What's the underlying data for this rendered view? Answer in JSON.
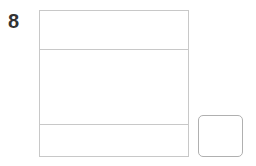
{
  "question": {
    "number": "8"
  },
  "main_box": {
    "rows": 3
  },
  "answer_box": {
    "value": ""
  }
}
